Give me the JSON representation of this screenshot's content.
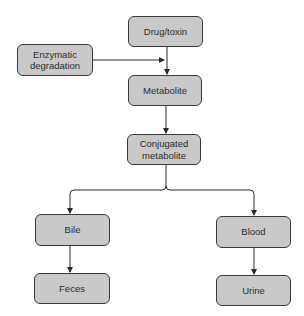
{
  "diagram": {
    "type": "flowchart",
    "colors": {
      "node_fill": "#c9c9c9",
      "node_border": "#3a3a3a",
      "edge": "#2b2b2b",
      "text": "#2b2b2b"
    },
    "nodes": {
      "drug": {
        "label": "Drug/toxin"
      },
      "enzymatic": {
        "label": "Enzymatic degradation"
      },
      "metabolite": {
        "label": "Metabolite"
      },
      "conjugated": {
        "label": "Conjugated metabolite"
      },
      "bile": {
        "label": "Bile"
      },
      "blood": {
        "label": "Blood"
      },
      "feces": {
        "label": "Feces"
      },
      "urine": {
        "label": "Urine"
      }
    },
    "edges": [
      {
        "from": "Drug/toxin",
        "to": "Metabolite"
      },
      {
        "from": "Enzymatic degradation",
        "to": "Metabolite"
      },
      {
        "from": "Metabolite",
        "to": "Conjugated metabolite"
      },
      {
        "from": "Conjugated metabolite",
        "to": "Bile"
      },
      {
        "from": "Conjugated metabolite",
        "to": "Blood"
      },
      {
        "from": "Bile",
        "to": "Feces"
      },
      {
        "from": "Blood",
        "to": "Urine"
      }
    ]
  }
}
